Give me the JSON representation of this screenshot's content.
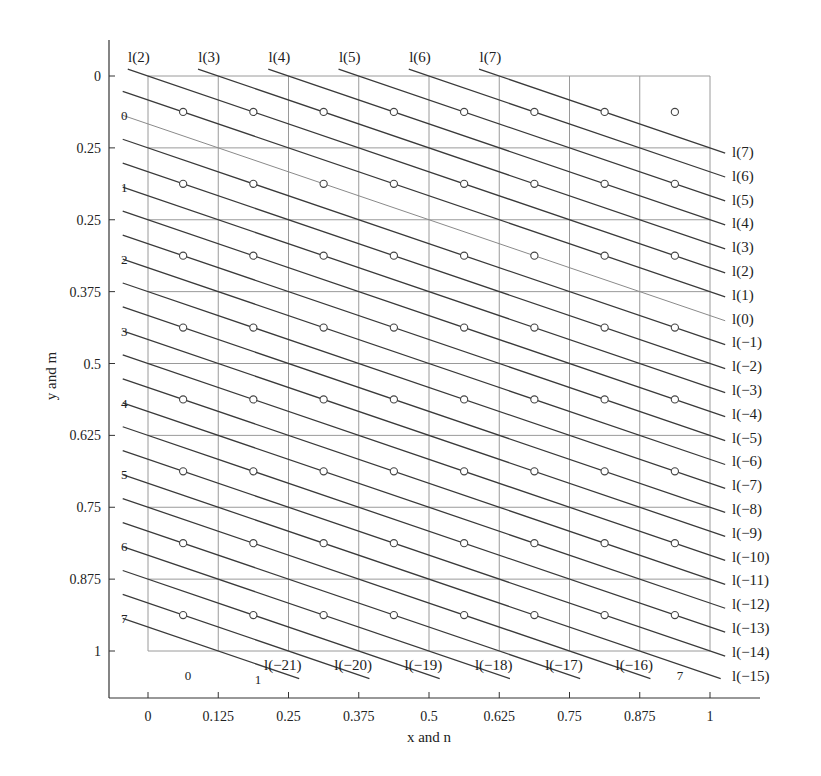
{
  "chart_data": {
    "type": "line",
    "title": "",
    "xlabel": "x and n",
    "ylabel": "y and m",
    "xlim": [
      0,
      1
    ],
    "ylim": [
      0,
      1
    ],
    "y_inverted": true,
    "grid": true,
    "x_ticks": [
      "0",
      "0.125",
      "0.25",
      "0.375",
      "0.5",
      "0.625",
      "0.75",
      "0.875",
      "1"
    ],
    "x_tick_values": [
      0,
      0.125,
      0.25,
      0.375,
      0.5,
      0.625,
      0.75,
      0.875,
      1
    ],
    "y_ticks": [
      "0",
      "0.25",
      "0.25",
      "0.375",
      "0.5",
      "0.625",
      "0.75",
      "0.875",
      "1"
    ],
    "y_tick_values": [
      0,
      0.125,
      0.25,
      0.375,
      0.5,
      0.625,
      0.75,
      0.875,
      1
    ],
    "column_labels": [
      {
        "label": "0",
        "n": 0
      },
      {
        "label": "1",
        "n": 1
      },
      {
        "label": "7",
        "n": 7
      }
    ],
    "row_labels": [
      "0",
      "1",
      "2",
      "3",
      "4",
      "5",
      "6",
      "7"
    ],
    "line_family": {
      "description": "Parallel lines l(k): y = (2 - k)/24 + x/3",
      "slope": 0.3333,
      "spacing_y": 0.041667,
      "highlighted_line": "l(0)"
    },
    "top_line_labels": [
      "l(2)",
      "l(3)",
      "l(4)",
      "l(5)",
      "l(6)",
      "l(7)"
    ],
    "top_line_k": [
      2,
      3,
      4,
      5,
      6,
      7
    ],
    "right_line_labels": [
      "l(7)",
      "l(6)",
      "l(5)",
      "l(4)",
      "l(3)",
      "l(2)",
      "l(1)",
      "l(0)",
      "l(−1)",
      "l(−2)",
      "l(−3)",
      "l(−4)",
      "l(−5)",
      "l(−6)",
      "l(−7)",
      "l(−8)",
      "l(−9)",
      "l(−10)",
      "l(−11)",
      "l(−12)",
      "l(−13)",
      "l(−14)",
      "l(−15)"
    ],
    "right_line_k": [
      7,
      6,
      5,
      4,
      3,
      2,
      1,
      0,
      -1,
      -2,
      -3,
      -4,
      -5,
      -6,
      -7,
      -8,
      -9,
      -10,
      -11,
      -12,
      -13,
      -14,
      -15
    ],
    "bottom_line_labels": [
      "l(−21)",
      "l(−20)",
      "l(−19)",
      "l(−18)",
      "l(−17)",
      "l(−16)"
    ],
    "bottom_line_k": [
      -21,
      -20,
      -19,
      -18,
      -17,
      -16
    ],
    "points": {
      "description": "Sample points at cell centers (n+0.5)/8, (m+0.5)/8 for n,m in 0..7",
      "grid_size": 8,
      "marker": "open-circle"
    },
    "colors": {
      "grid": "#9a9a9a",
      "line": "#3a3a3a",
      "highlight_line": "#8a8a8a",
      "axis": "#333333",
      "text": "#222222"
    }
  }
}
